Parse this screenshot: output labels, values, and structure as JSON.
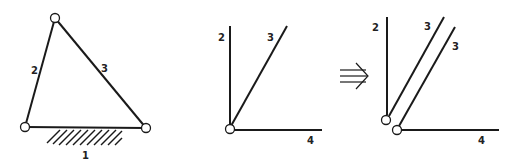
{
  "figure": {
    "left": {
      "labels": {
        "ground": "1",
        "link_a": "2",
        "link_b": "3"
      }
    },
    "middle": {
      "labels": {
        "link_a": "2",
        "link_b": "3",
        "link_c": "4"
      }
    },
    "arrow": {
      "symbol": "implies-arrow"
    },
    "right": {
      "labels": {
        "link_a": "2",
        "link_b1": "3",
        "link_b2": "3",
        "link_c": "4"
      }
    }
  },
  "colors": {
    "stroke": "#1a1a1a",
    "background": "#ffffff"
  }
}
